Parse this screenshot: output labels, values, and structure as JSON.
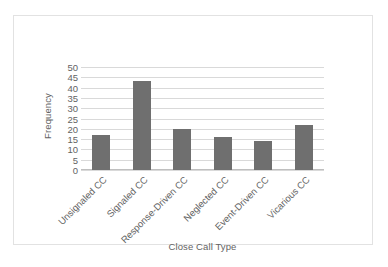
{
  "chart_data": {
    "type": "bar",
    "title": "",
    "subtitle": "",
    "categories": [
      "Unsignaled CC",
      "Signaled CC",
      "Response-Driven CC",
      "Neglected CC",
      "Event-Driven CC",
      "Vicarious CC"
    ],
    "values": [
      17,
      43,
      20,
      16,
      14,
      22
    ],
    "xlabel": "Close Call Type",
    "ylabel": "Frequency",
    "ylim": [
      0,
      50
    ],
    "ytick_step": 5,
    "yticks": [
      0,
      5,
      10,
      15,
      20,
      25,
      30,
      35,
      40,
      45,
      50
    ],
    "ytick_labels": [
      "0",
      "5",
      "10",
      "15",
      "20",
      "25",
      "30",
      "35",
      "40",
      "45",
      "50"
    ],
    "grid": true,
    "grid_axis": "y",
    "legend": false,
    "legend_position": "none",
    "bar_color": "#6f6f6f",
    "gridline_color": "#d9d9d9",
    "axis_color": "#bfbfbf",
    "text_color": "#636363",
    "background_color": "#ffffff",
    "xtick_rotation": -45
  }
}
